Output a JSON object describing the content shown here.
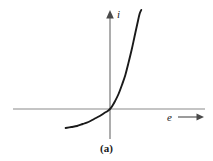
{
  "figure": {
    "caption": "(a)",
    "background_color": "#ffffff",
    "curve_color": "#1a1a1a",
    "axis_color": "#8a8a8a",
    "text_color": "#1a1a1a"
  },
  "axes": {
    "vertical": {
      "label": "i",
      "name": "current",
      "arrow": "up",
      "origin_x": 110,
      "top_y": 12,
      "bottom_y": 139
    },
    "horizontal": {
      "label": "e",
      "name": "voltage",
      "arrow": "right",
      "origin_y": 109,
      "left_x": 13,
      "right_x": 205,
      "label_arrow_start_x": 178,
      "label_arrow_end_x": 203
    }
  },
  "chart_data": {
    "type": "line",
    "title": "",
    "subtitle": "",
    "xlabel": "e",
    "ylabel": "i",
    "grid": false,
    "legend": null,
    "annotations": [
      "(a)"
    ],
    "xlim": [
      -78,
      95
    ],
    "ylim": [
      -19,
      99
    ],
    "series": [
      {
        "name": "i = f(e)",
        "points": [
          [
            -78,
            -19
          ],
          [
            -68,
            -18
          ],
          [
            -58,
            -17
          ],
          [
            -48,
            -15
          ],
          [
            -38,
            -13
          ],
          [
            -28,
            -10
          ],
          [
            -18,
            -7
          ],
          [
            -10,
            -4
          ],
          [
            -4,
            -2
          ],
          [
            0,
            0
          ],
          [
            4,
            3
          ],
          [
            9,
            8
          ],
          [
            15,
            15
          ],
          [
            21,
            24
          ],
          [
            27,
            34
          ],
          [
            32,
            45
          ],
          [
            38,
            59
          ],
          [
            43,
            72
          ],
          [
            48,
            85
          ],
          [
            52,
            95
          ],
          [
            55,
            99
          ]
        ]
      }
    ]
  }
}
